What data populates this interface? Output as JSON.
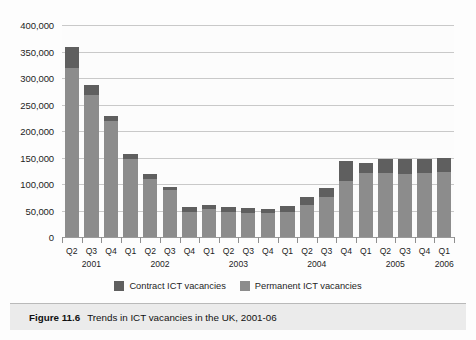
{
  "caption": {
    "number": "Figure 11.6",
    "text": "Trends in ICT vacancies in the UK, 2001-06"
  },
  "legend": [
    {
      "label": "Contract ICT vacancies",
      "color": "#5f5f5f"
    },
    {
      "label": "Permanent ICT vacancies",
      "color": "#8c8c8c"
    }
  ],
  "chart_data": {
    "type": "bar",
    "stacked": true,
    "title": "Trends in ICT vacancies in the UK, 2001-06",
    "xlabel": "",
    "ylabel": "",
    "ylim": [
      0,
      400000
    ],
    "ytick_values": [
      0,
      50000,
      100000,
      150000,
      200000,
      250000,
      300000,
      350000,
      400000
    ],
    "ytick_labels": [
      "0",
      "50,000",
      "100,000",
      "150,000",
      "200,000",
      "250,000",
      "300,000",
      "350,000",
      "400,000"
    ],
    "grid": true,
    "legend_position": "bottom",
    "categories": [
      "Q2",
      "Q3",
      "Q4",
      "Q1",
      "Q2",
      "Q3",
      "Q4",
      "Q1",
      "Q2",
      "Q3",
      "Q4",
      "Q1",
      "Q2",
      "Q3",
      "Q4",
      "Q1",
      "Q2",
      "Q3",
      "Q4",
      "Q1"
    ],
    "x": [
      "Q2",
      "Q3",
      "Q4",
      "Q1",
      "Q2",
      "Q3",
      "Q4",
      "Q1",
      "Q2",
      "Q3",
      "Q4",
      "Q1",
      "Q2",
      "Q3",
      "Q4",
      "Q1",
      "Q2",
      "Q3",
      "Q4",
      "Q1"
    ],
    "year_groups": [
      {
        "label": "2001",
        "start_index": 0,
        "count": 3
      },
      {
        "label": "2002",
        "start_index": 3,
        "count": 4
      },
      {
        "label": "2003",
        "start_index": 7,
        "count": 4
      },
      {
        "label": "2004",
        "start_index": 11,
        "count": 4
      },
      {
        "label": "2005",
        "start_index": 15,
        "count": 4
      },
      {
        "label": "2006",
        "start_index": 19,
        "count": 1
      }
    ],
    "series": [
      {
        "name": "Permanent ICT vacancies",
        "color": "#8c8c8c",
        "values": [
          318000,
          268000,
          218000,
          148000,
          110000,
          88000,
          48000,
          52000,
          48000,
          46000,
          45000,
          48000,
          60000,
          75000,
          105000,
          120000,
          120000,
          118000,
          120000,
          122000
        ]
      },
      {
        "name": "Contract ICT vacancies",
        "color": "#5f5f5f",
        "values": [
          40000,
          18000,
          10000,
          9000,
          8000,
          7000,
          8000,
          8000,
          8000,
          8000,
          8000,
          10000,
          15000,
          18000,
          38000,
          20000,
          28000,
          30000,
          28000,
          28000
        ]
      }
    ],
    "totals": [
      358000,
      286000,
      228000,
      157000,
      118000,
      95000,
      56000,
      60000,
      56000,
      54000,
      53000,
      58000,
      75000,
      93000,
      143000,
      140000,
      148000,
      148000,
      148000,
      150000
    ]
  }
}
